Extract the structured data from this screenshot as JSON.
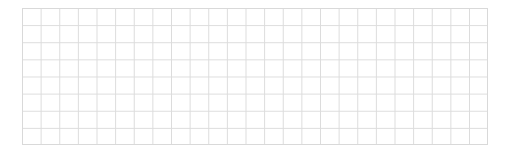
{
  "grid": {
    "columns": 25,
    "rows": 8,
    "line_color": "#dcdcdc",
    "background_color": "#ffffff"
  }
}
